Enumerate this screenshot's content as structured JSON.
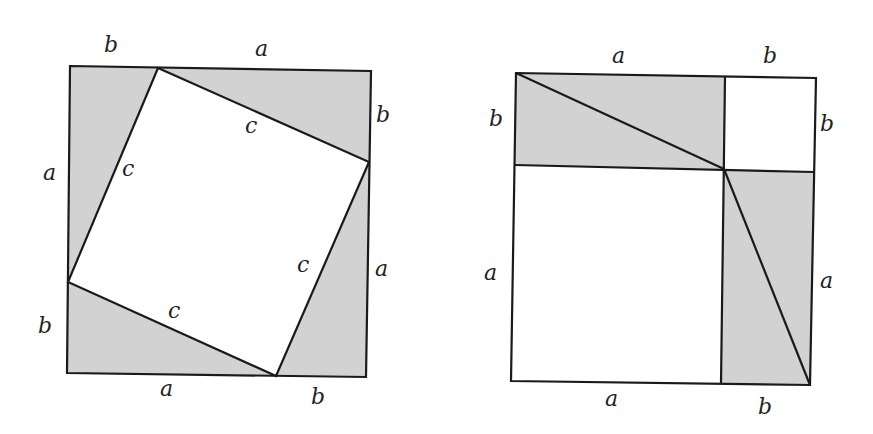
{
  "figure": {
    "title": ""
  },
  "colors": {
    "shade": "#d2d2d2",
    "stroke": "#1a1a1a",
    "background": "#ffffff"
  },
  "left_square": {
    "labels": {
      "top_b": "b",
      "top_a": "a",
      "right_b": "b",
      "right_a": "a",
      "bottom_a": "a",
      "bottom_b": "b",
      "left_a": "a",
      "left_b": "b",
      "hyp_top": "c",
      "hyp_left": "c",
      "hyp_right": "c",
      "hyp_bottom": "c"
    }
  },
  "right_square": {
    "labels": {
      "top_a": "a",
      "top_b": "b",
      "left_b": "b",
      "left_a": "a",
      "right_b": "b",
      "right_a": "a",
      "bottom_a": "a",
      "bottom_b": "b"
    }
  }
}
